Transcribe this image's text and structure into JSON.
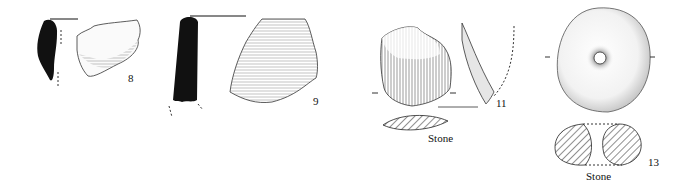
{
  "figure": {
    "type": "archaeological-finds-plate",
    "background": "#ffffff",
    "ink": "#111111"
  },
  "items": [
    {
      "number": "8",
      "kind": "pottery sherd",
      "views": [
        "profile-section",
        "exterior"
      ],
      "material_label": ""
    },
    {
      "number": "9",
      "kind": "pottery sherd",
      "views": [
        "profile-section",
        "exterior"
      ],
      "material_label": ""
    },
    {
      "number": "11",
      "kind": "stone tool",
      "views": [
        "face",
        "side",
        "cross-section"
      ],
      "material_label": "Stone"
    },
    {
      "number": "13",
      "kind": "perforated stone",
      "views": [
        "face",
        "cross-section"
      ],
      "material_label": "Stone"
    }
  ]
}
